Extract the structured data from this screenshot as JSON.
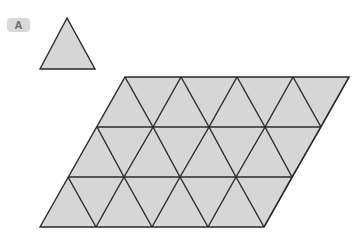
{
  "label": {
    "text": "A"
  },
  "colors": {
    "fill": "#d6d6d6",
    "stroke": "#2a2a2a",
    "badge_bg": "#d9d9d9",
    "badge_text": "#6a6a6a"
  },
  "single_triangle": {
    "apex": [
      67,
      18
    ],
    "base_left": [
      40,
      69
    ],
    "base_right": [
      95,
      69
    ]
  },
  "tiling": {
    "shape": "parallelogram",
    "rows": 3,
    "triangles_per_row_base": 4,
    "total_triangles": 24,
    "row_y": [
      77,
      127,
      177,
      227
    ],
    "row_x_start": [
      125,
      97,
      68,
      40
    ],
    "side": 56
  }
}
